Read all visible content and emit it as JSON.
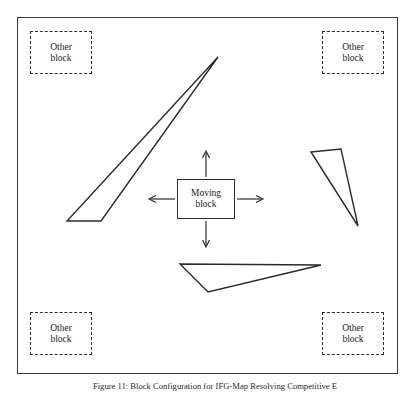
{
  "figure": {
    "caption": "Figure 11: Block Configuration for IFG-Map Resolving Competitive E",
    "frame": {
      "x": 17,
      "y": 17,
      "width": 381,
      "height": 357,
      "stroke_color": "#3a3a3a"
    }
  },
  "moving_block": {
    "line1": "Moving",
    "line2": "block",
    "x": 177,
    "y": 179,
    "width": 58,
    "height": 40,
    "stroke_color": "#2b2b2b"
  },
  "direction_arrows": [
    {
      "name": "arrow-up",
      "from_x": 206,
      "from_y": 177,
      "to_x": 206,
      "to_y": 152
    },
    {
      "name": "arrow-down",
      "from_x": 206,
      "from_y": 221,
      "to_x": 206,
      "to_y": 246
    },
    {
      "name": "arrow-left",
      "from_x": 175,
      "from_y": 199,
      "to_x": 150,
      "to_y": 199
    },
    {
      "name": "arrow-right",
      "from_x": 237,
      "from_y": 199,
      "to_x": 262,
      "to_y": 199
    }
  ],
  "other_blocks": [
    {
      "id": "top-left",
      "line1": "Other",
      "line2": "block",
      "x": 30,
      "y": 31,
      "width": 62,
      "height": 43
    },
    {
      "id": "top-right",
      "line1": "Other",
      "line2": "block",
      "x": 322,
      "y": 31,
      "width": 62,
      "height": 43
    },
    {
      "id": "bottom-left",
      "line1": "Other",
      "line2": "block",
      "x": 30,
      "y": 312,
      "width": 62,
      "height": 43
    },
    {
      "id": "bottom-right",
      "line1": "Other",
      "line2": "block",
      "x": 322,
      "y": 312,
      "width": 62,
      "height": 43
    }
  ],
  "obstacles": [
    {
      "id": "sliver-left",
      "shape": "triangle",
      "points": "218,57 67,221 101,221",
      "stroke_color": "#2b2b2b"
    },
    {
      "id": "triangle-right",
      "shape": "triangle",
      "points": "311,152 341,149 358,226",
      "stroke_color": "#2b2b2b"
    },
    {
      "id": "triangle-bottom",
      "shape": "triangle",
      "points": "180,264 321,265 208,292",
      "stroke_color": "#2b2b2b"
    }
  ],
  "colors": {
    "stroke": "#2b2b2b",
    "frame": "#3a3a3a",
    "background": "#ffffff",
    "text": "#1a1a1a"
  }
}
